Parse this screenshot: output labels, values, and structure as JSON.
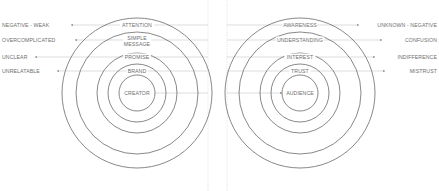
{
  "colors": {
    "ring": "#555555",
    "guide_line": "#c8c8c8",
    "divider": "#d4d4d4",
    "text": "#6e6e6e",
    "arrow": "#9a9a9a"
  },
  "left_group": {
    "name": "creator-side",
    "center": {
      "x": 137,
      "y": 93
    },
    "rings": [
      {
        "label": "ATTENTION",
        "radius": 75,
        "label_y": 25
      },
      {
        "label": "SIMPLE MESSAGE",
        "label_line1": "SIMPLE",
        "label_line2": "MESSAGE",
        "radius": 61,
        "label_y": 41
      },
      {
        "label": "PROMISE",
        "radius": 40,
        "label_y": 57
      },
      {
        "label": "BRAND",
        "radius": 29,
        "label_y": 71
      },
      {
        "label": "CREATOR",
        "radius": 18,
        "label_y": 93
      }
    ],
    "outcomes": [
      {
        "label": "NEGATIVE - WEAK",
        "y": 25
      },
      {
        "label": "OVERCOMPLICATED",
        "y": 40
      },
      {
        "label": "UNCLEAR",
        "y": 57
      },
      {
        "label": "UNRELATABLE",
        "y": 71
      }
    ]
  },
  "right_group": {
    "name": "audience-side",
    "center": {
      "x": 300,
      "y": 93
    },
    "rings": [
      {
        "label": "AWARENESS",
        "radius": 75,
        "label_y": 25
      },
      {
        "label": "UNDERSTANDING",
        "radius": 61,
        "label_y": 40
      },
      {
        "label": "INTEREST",
        "radius": 40,
        "label_y": 57
      },
      {
        "label": "TRUST",
        "radius": 29,
        "label_y": 71
      },
      {
        "label": "AUDIENCE",
        "radius": 18,
        "label_y": 93
      }
    ],
    "outcomes": [
      {
        "label": "UNKNOWN - NEGATIVE",
        "y": 25
      },
      {
        "label": "CONFUSION",
        "y": 40
      },
      {
        "label": "INDIFFERENCE",
        "y": 57
      },
      {
        "label": "MISTRUST",
        "y": 71
      }
    ]
  },
  "dividers": [
    {
      "x": 208
    },
    {
      "x": 227
    }
  ]
}
